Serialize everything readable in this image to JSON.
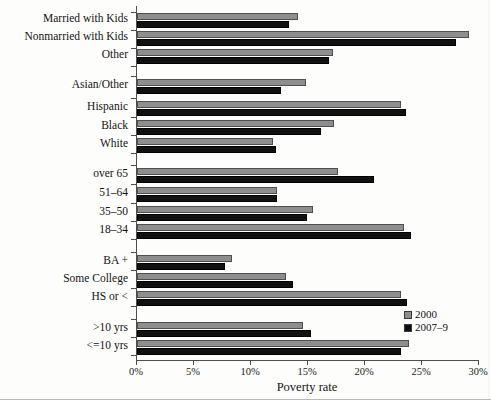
{
  "chart_data": {
    "type": "bar",
    "orientation": "horizontal",
    "title": "",
    "xlabel": "Poverty rate",
    "ylabel": "",
    "xlim": [
      0,
      30
    ],
    "xticks": [
      0,
      5,
      10,
      15,
      20,
      25,
      30
    ],
    "xticklabels": [
      "0%",
      "5%",
      "10%",
      "15%",
      "20%",
      "25%",
      "30%"
    ],
    "grid": false,
    "legend_position": "right-bottom",
    "legend": [
      "2000",
      "2007–9"
    ],
    "categories": [
      "Married with Kids",
      "Nonmarried with Kids",
      "Other",
      "Asian/Other",
      "Hispanic",
      "Black",
      "White",
      "over 65",
      "51–64",
      "35–50",
      "18–34",
      "BA +",
      "Some College",
      "HS or <",
      ">10 yrs",
      "<=10 yrs"
    ],
    "groups": [
      {
        "name": "family-type",
        "categories": [
          "Married with Kids",
          "Nonmarried with Kids",
          "Other"
        ]
      },
      {
        "name": "race-ethnicity",
        "categories": [
          "Asian/Other",
          "Hispanic",
          "Black",
          "White"
        ]
      },
      {
        "name": "age",
        "categories": [
          "over 65",
          "51–64",
          "35–50",
          "18–34"
        ]
      },
      {
        "name": "education",
        "categories": [
          "BA +",
          "Some College",
          "HS or <"
        ]
      },
      {
        "name": "tenure",
        "categories": [
          ">10 yrs",
          "<=10 yrs"
        ]
      }
    ],
    "series": [
      {
        "name": "2000",
        "color": "#8e8e8e",
        "values": [
          14.1,
          29.1,
          17.2,
          14.8,
          23.2,
          17.3,
          11.9,
          17.6,
          12.3,
          15.4,
          23.4,
          8.3,
          13.1,
          23.2,
          14.6,
          23.9
        ]
      },
      {
        "name": "2007–9",
        "color": "#111111",
        "values": [
          13.3,
          28.0,
          16.8,
          12.6,
          23.6,
          16.1,
          12.2,
          20.8,
          12.3,
          14.9,
          24.0,
          7.7,
          13.7,
          23.7,
          15.3,
          23.2
        ]
      }
    ]
  },
  "layout": {
    "rows": [
      {
        "label": "Married with Kids",
        "top": 7
      },
      {
        "label": "Nonmarried with Kids",
        "top": 25
      },
      {
        "label": "Other",
        "top": 43
      },
      {
        "label": "Asian/Other",
        "top": 73
      },
      {
        "label": "Hispanic",
        "top": 95
      },
      {
        "label": "Black",
        "top": 114
      },
      {
        "label": "White",
        "top": 132
      },
      {
        "label": "over 65",
        "top": 162
      },
      {
        "label": "51–64",
        "top": 181
      },
      {
        "label": "35–50",
        "top": 200
      },
      {
        "label": "18–34",
        "top": 218
      },
      {
        "label": "BA +",
        "top": 249
      },
      {
        "label": "Some College",
        "top": 267
      },
      {
        "label": "HS or <",
        "top": 285
      },
      {
        "label": ">10 yrs",
        "top": 316
      },
      {
        "label": "<=10 yrs",
        "top": 334
      }
    ],
    "y_tick_positions": [
      6,
      24,
      42,
      60,
      70,
      92,
      111,
      129,
      147,
      159,
      178,
      197,
      215,
      233,
      246,
      264,
      282,
      300,
      313,
      331,
      349
    ]
  }
}
